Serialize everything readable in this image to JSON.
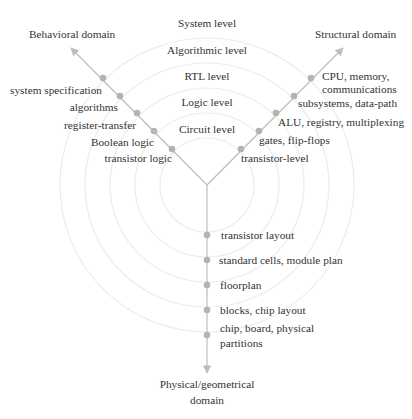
{
  "colors": {
    "axis": "#bdbdbd",
    "dot": "#b3b3b3",
    "ring": "#eeeeee",
    "text": "#333333"
  },
  "diagram": {
    "center": {
      "x": 207,
      "y": 185
    },
    "ring_radii": [
      47,
      72,
      97,
      122,
      147
    ],
    "levels": [
      {
        "label": "System level",
        "x": 207,
        "y": 24
      },
      {
        "label": "Algorithmic level",
        "x": 207,
        "y": 51
      },
      {
        "label": "RTL level",
        "x": 207,
        "y": 77
      },
      {
        "label": "Logic level",
        "x": 207,
        "y": 103
      },
      {
        "label": "Circuit level",
        "x": 207,
        "y": 129
      }
    ],
    "domains": {
      "behavioral": {
        "label": "Behavioral domain",
        "items": [
          "system specification",
          "algorithms",
          "register-transfer",
          "Boolean logic",
          "transistor logic"
        ]
      },
      "structural": {
        "label": "Structural domain",
        "items": [
          "CPU, memory, communications",
          "subsystems, data-path",
          "ALU, registry, multiplexing",
          "gates, flip-flops",
          "transistor-level"
        ]
      },
      "physical": {
        "label": "Physical/geometrical domain",
        "label_line1": "Physical/geometrical",
        "label_line2": "domain",
        "items": [
          "transistor layout",
          "standard cells, module plan",
          "floorplan",
          "blocks, chip layout",
          "chip, board, physical partitions"
        ],
        "last_item_line1": "chip, board, physical",
        "last_item_line2": "partitions"
      }
    }
  }
}
